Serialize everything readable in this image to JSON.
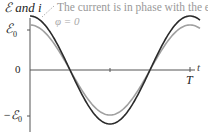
{
  "chart_data": {
    "type": "line",
    "title": "",
    "ylabel": "ℰ and i",
    "xlabel": "t",
    "x_tick_labels": [
      "T"
    ],
    "y_tick_labels": [
      "ℰ0",
      "0",
      "−ℰ0"
    ],
    "annotation": "The current is in phase with the emf.",
    "phase_label": "φ = 0",
    "series": [
      {
        "name": "emf ℰ",
        "color": "#2a2a2a",
        "amplitude": 1.0,
        "function": "cos(2πt/T)"
      },
      {
        "name": "current i",
        "color": "#9a9a9a",
        "amplitude": 0.8,
        "function": "cos(2πt/T)"
      }
    ],
    "xlim": [
      0,
      1.05
    ],
    "ylim": [
      -1.1,
      1.2
    ]
  },
  "labels": {
    "y_axis": "ℰ and i",
    "x_axis": "t",
    "t_period": "T",
    "e0": "ℰ",
    "e0_sub": "0",
    "neg_e0": "−ℰ",
    "neg_e0_sub": "0",
    "zero": "0",
    "annotation": "The current is in phase with the emf.",
    "phase": "φ = 0"
  }
}
